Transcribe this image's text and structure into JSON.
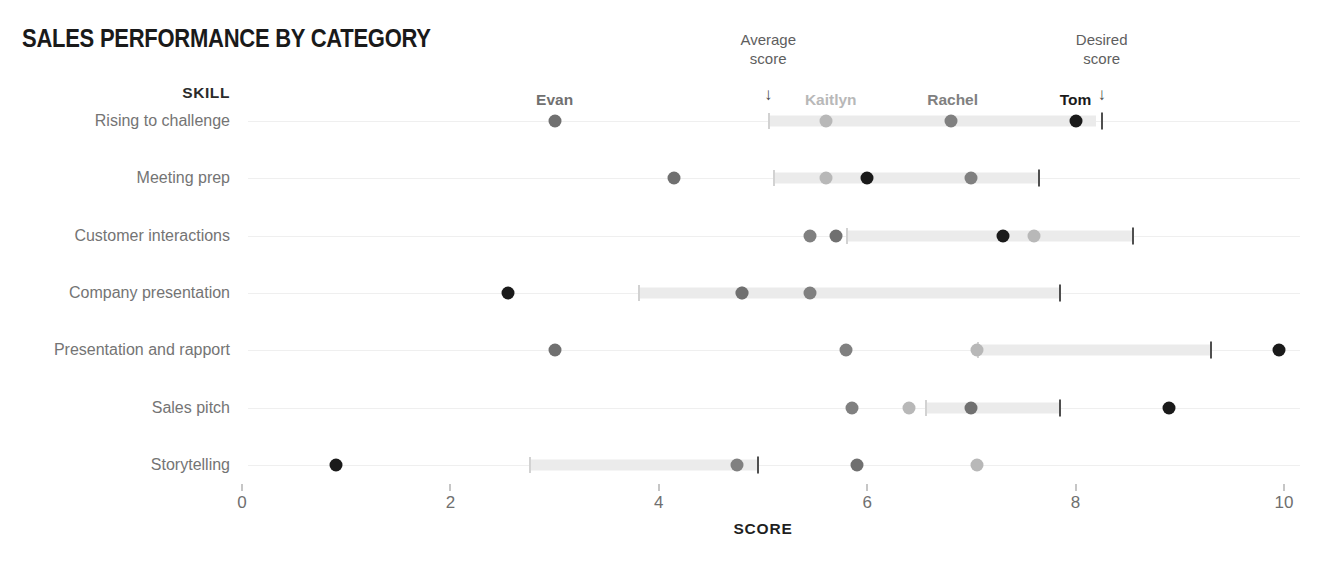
{
  "chart_data": {
    "type": "scatter",
    "title": "SALES PERFORMANCE BY CATEGORY",
    "xlabel": "SCORE",
    "ylabel": "SKILL",
    "xlim": [
      0,
      10
    ],
    "xticks": [
      0,
      2,
      4,
      6,
      8,
      10
    ],
    "xtick_labels": [
      "0",
      "2",
      "4",
      "6",
      "8",
      "10"
    ],
    "grid": false,
    "legend_position": "top",
    "categories": [
      "Rising to challenge",
      "Meeting prep",
      "Customer interactions",
      "Company presentation",
      "Presentation and rapport",
      "Sales pitch",
      "Storytelling"
    ],
    "series": [
      {
        "name": "Evan",
        "color": "#707070",
        "values": [
          3.0,
          4.15,
          5.7,
          4.8,
          3.0,
          7.0,
          5.9
        ]
      },
      {
        "name": "Kaitlyn",
        "color": "#b8b8b8",
        "values": [
          5.6,
          5.6,
          7.6,
          4.8,
          7.05,
          6.4,
          7.05
        ]
      },
      {
        "name": "Rachel",
        "color": "#808080",
        "values": [
          6.8,
          7.0,
          5.45,
          5.45,
          5.8,
          5.85,
          4.75
        ]
      },
      {
        "name": "Tom",
        "color": "#1a1a1a",
        "values": [
          8.0,
          6.0,
          7.3,
          2.55,
          9.95,
          8.9,
          0.9
        ]
      }
    ],
    "average_score": {
      "label": "Average\nscore",
      "label_line1": "Average",
      "label_line2": "score",
      "color": "#ebebeb",
      "ranges": [
        {
          "start": 5.05,
          "end": 8.2
        },
        {
          "start": 5.1,
          "end": 7.65
        },
        {
          "start": 5.8,
          "end": 8.55
        },
        {
          "start": 3.8,
          "end": 7.85
        },
        {
          "start": 7.05,
          "end": 9.3
        },
        {
          "start": 6.55,
          "end": 7.85
        },
        {
          "start": 2.75,
          "end": 4.95
        }
      ]
    },
    "desired_score": {
      "label_line1": "Desired",
      "label_line2": "score",
      "color": "#4f4f4f",
      "values": [
        8.25,
        7.65,
        8.55,
        7.85,
        9.3,
        7.85,
        4.95
      ]
    },
    "annotations": [
      {
        "name": "average-score-annotation",
        "text_line1": "Average",
        "text_line2": "score",
        "arrow": "↓",
        "at_x": 5.05
      },
      {
        "name": "desired-score-annotation",
        "text_line1": "Desired",
        "text_line2": "score",
        "arrow": "↓",
        "at_x": 8.25
      }
    ],
    "person_header_labels": [
      {
        "name": "Evan",
        "x": 3.0,
        "color": "#707070"
      },
      {
        "name": "Kaitlyn",
        "x": 5.65,
        "color": "#b8b8b8"
      },
      {
        "name": "Rachel",
        "x": 6.82,
        "color": "#808080"
      },
      {
        "name": "Tom",
        "x": 8.0,
        "color": "#1a1a1a"
      }
    ]
  }
}
